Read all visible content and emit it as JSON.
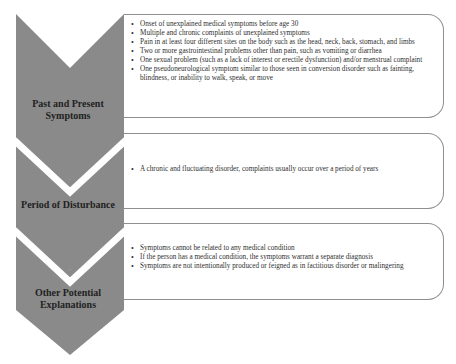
{
  "diagram": {
    "colors": {
      "chevron": "#8a8a8a",
      "box_border": "#8f8f8f",
      "background": "#ffffff"
    },
    "sections": [
      {
        "label": "Past and Present Symptoms",
        "label_lines": [
          "Past and Present",
          "Symptoms"
        ],
        "items": [
          "Onset of unexplained medical symptoms before age 30",
          "Multiple and chronic complaints of unexplained symptoms",
          "Pain in at least four different sites on the body such as the head, neck, back, stomach, and limbs",
          "Two or more gastrointestinal problems other than pain, such as vomiting or diarrhea",
          "One sexual problem (such as a lack of interest or erectile dysfunction) and/or menstrual complaint",
          "One pseudoneurological symptom similar to those seen in conversion disorder such as fainting, blindness, or inability to walk, speak, or move"
        ]
      },
      {
        "label": "Period of Disturbance",
        "label_lines": [
          "Period of Disturbance"
        ],
        "items": [
          "A chronic and fluctuating disorder, complaints usually occur over a period of years"
        ]
      },
      {
        "label": "Other Potential Explanations",
        "label_lines": [
          "Other Potential",
          "Explanations"
        ],
        "items": [
          "Symptoms cannot be related to any medical condition",
          "If the person has a medical condition, the symptoms warrant a separate diagnosis",
          "Symptoms are not intentionally produced or feigned as in factitious disorder or malingering"
        ]
      }
    ]
  }
}
